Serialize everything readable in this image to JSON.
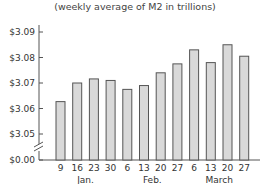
{
  "chart_data": {
    "type": "bar",
    "title": "",
    "subtitle": "(weekly average of M2 in trillions)",
    "xlabel": "",
    "ylabel": "",
    "categories": [
      "9",
      "16",
      "23",
      "30",
      "6",
      "13",
      "20",
      "27",
      "6",
      "13",
      "20",
      "27"
    ],
    "month_groups": [
      {
        "label": "Jan.",
        "start": 0,
        "end": 3
      },
      {
        "label": "Feb.",
        "start": 4,
        "end": 7
      },
      {
        "label": "March",
        "start": 8,
        "end": 11
      }
    ],
    "values": [
      3.0627,
      3.07,
      3.0716,
      3.071,
      3.0675,
      3.069,
      3.074,
      3.0775,
      3.083,
      3.078,
      3.085,
      3.0805
    ],
    "y_ticks": [
      "$0.00",
      "$3.05",
      "$3.06",
      "$3.07",
      "$3.08",
      "$3.09"
    ],
    "ylim": [
      3.05,
      3.09
    ],
    "axis_break": true,
    "grid": false,
    "legend": null,
    "colors": {
      "bar_fill": "#d9d9d9",
      "bar_stroke": "#555555",
      "axis": "#555555"
    }
  }
}
